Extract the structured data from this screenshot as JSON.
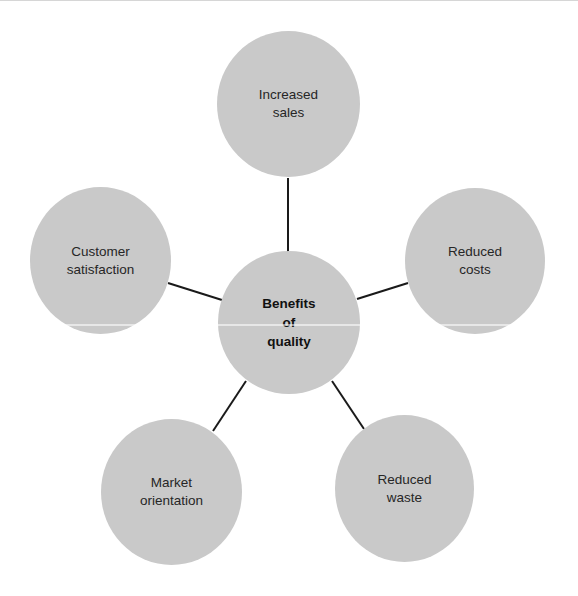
{
  "diagram": {
    "title": "Benefits of quality",
    "type": "radial hub-and-spoke",
    "center": {
      "label": "Benefits\nof\nquality"
    },
    "nodes": [
      {
        "id": "increased-sales",
        "label": "Increased\nsales"
      },
      {
        "id": "reduced-costs",
        "label": "Reduced\ncosts"
      },
      {
        "id": "reduced-waste",
        "label": "Reduced\nwaste"
      },
      {
        "id": "market-orientation",
        "label": "Market\norientation"
      },
      {
        "id": "customer-satisfaction",
        "label": "Customer\nsatisfaction"
      }
    ],
    "colors": {
      "node_fill": "#c9c9c9",
      "connector": "#1a1a1a",
      "text": "#262626"
    }
  }
}
